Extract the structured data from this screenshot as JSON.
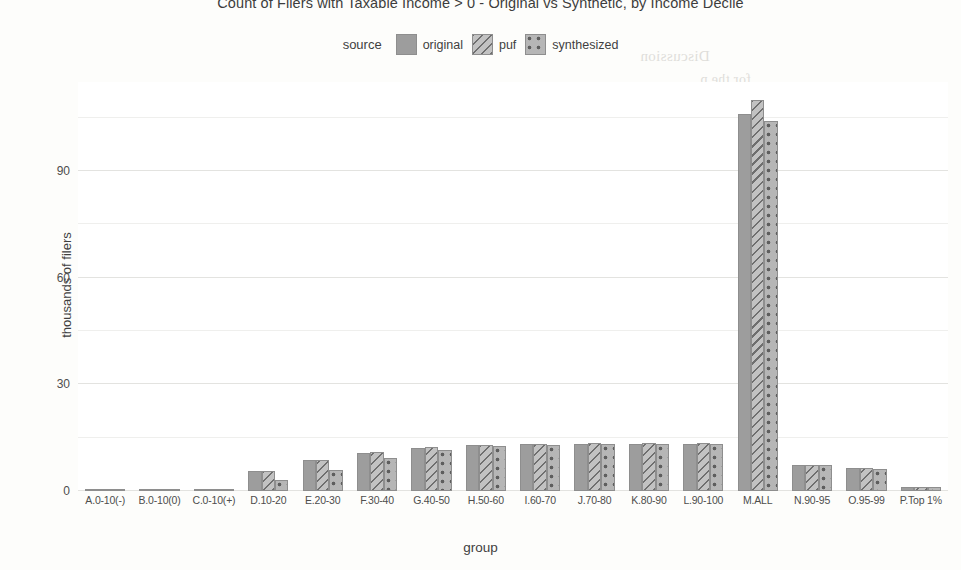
{
  "chart_data": {
    "type": "bar",
    "title": "Count of Filers with Taxable Income > 0 - Original vs Synthetic, by Income Decile",
    "xlabel": "group",
    "ylabel": "thousands of filers",
    "legend_title": "source",
    "legend_position": "top",
    "grid": true,
    "ylim": [
      0,
      115
    ],
    "yticks": [
      0,
      30,
      60,
      90
    ],
    "ytick_labels": [
      "0",
      "30",
      "60",
      "90"
    ],
    "categories": [
      "A.0-10(-)",
      "B.0-10(0)",
      "C.0-10(+)",
      "D.10-20",
      "E.20-30",
      "F.30-40",
      "G.40-50",
      "H.50-60",
      "I.60-70",
      "J.70-80",
      "K.80-90",
      "L.90-100",
      "M.ALL",
      "N.90-95",
      "O.95-99",
      "P.Top 1%"
    ],
    "series": [
      {
        "name": "original",
        "pattern": "solid",
        "color": "#9d9d9d",
        "values": [
          0.1,
          0.2,
          0.5,
          5.5,
          8.6,
          10.8,
          12.2,
          12.8,
          13.2,
          13.3,
          13.3,
          13.3,
          106,
          7.3,
          6.4,
          1.1
        ]
      },
      {
        "name": "puf",
        "pattern": "diagonal-hatch",
        "color": "#c2c2c2",
        "values": [
          0.1,
          0.2,
          0.5,
          5.5,
          8.6,
          11.0,
          12.3,
          12.9,
          13.3,
          13.4,
          13.4,
          13.4,
          110,
          7.4,
          6.5,
          1.1
        ]
      },
      {
        "name": "synthesized",
        "pattern": "dotted",
        "color": "#b6b6b6",
        "values": [
          0.1,
          0.2,
          0.4,
          3.1,
          6.0,
          9.4,
          11.6,
          12.6,
          13.0,
          13.2,
          13.2,
          13.2,
          104,
          7.2,
          6.3,
          1.0
        ]
      }
    ]
  },
  "bleed_through": {
    "lines": [
      "Discussion",
      "for the p",
      "ine work",
      "analysis",
      "values",
      "no pars",
      "Public",
      "transparent",
      "Office",
      "71.2.40",
      "Dataset",
      "database",
      "Research"
    ]
  }
}
